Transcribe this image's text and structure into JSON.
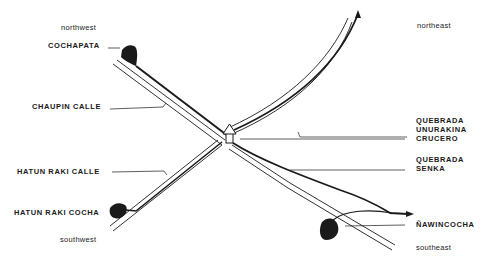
{
  "diagram": {
    "directions": {
      "northwest": "northwest",
      "northeast": "northeast",
      "southwest": "southwest",
      "southeast": "southeast"
    },
    "labels": {
      "cochapata": "COCHAPATA",
      "chaupin_calle": "CHAUPIN CALLE",
      "hatun_raki_calle": "HATUN RAKI CALLE",
      "hatun_raki_cocha": "HATUN RAKI COCHA",
      "quebrada_unurakina_1": "QUEBRADA",
      "quebrada_unurakina_2": "UNURAKINA",
      "crucero": "CRUCERO",
      "quebrada_senka_1": "QUEBRADA",
      "quebrada_senka_2": "SENKA",
      "nawincocha": "ÑAWINCOCHA"
    },
    "colors": {
      "ink": "#1a1a1a",
      "background": "#ffffff"
    }
  }
}
